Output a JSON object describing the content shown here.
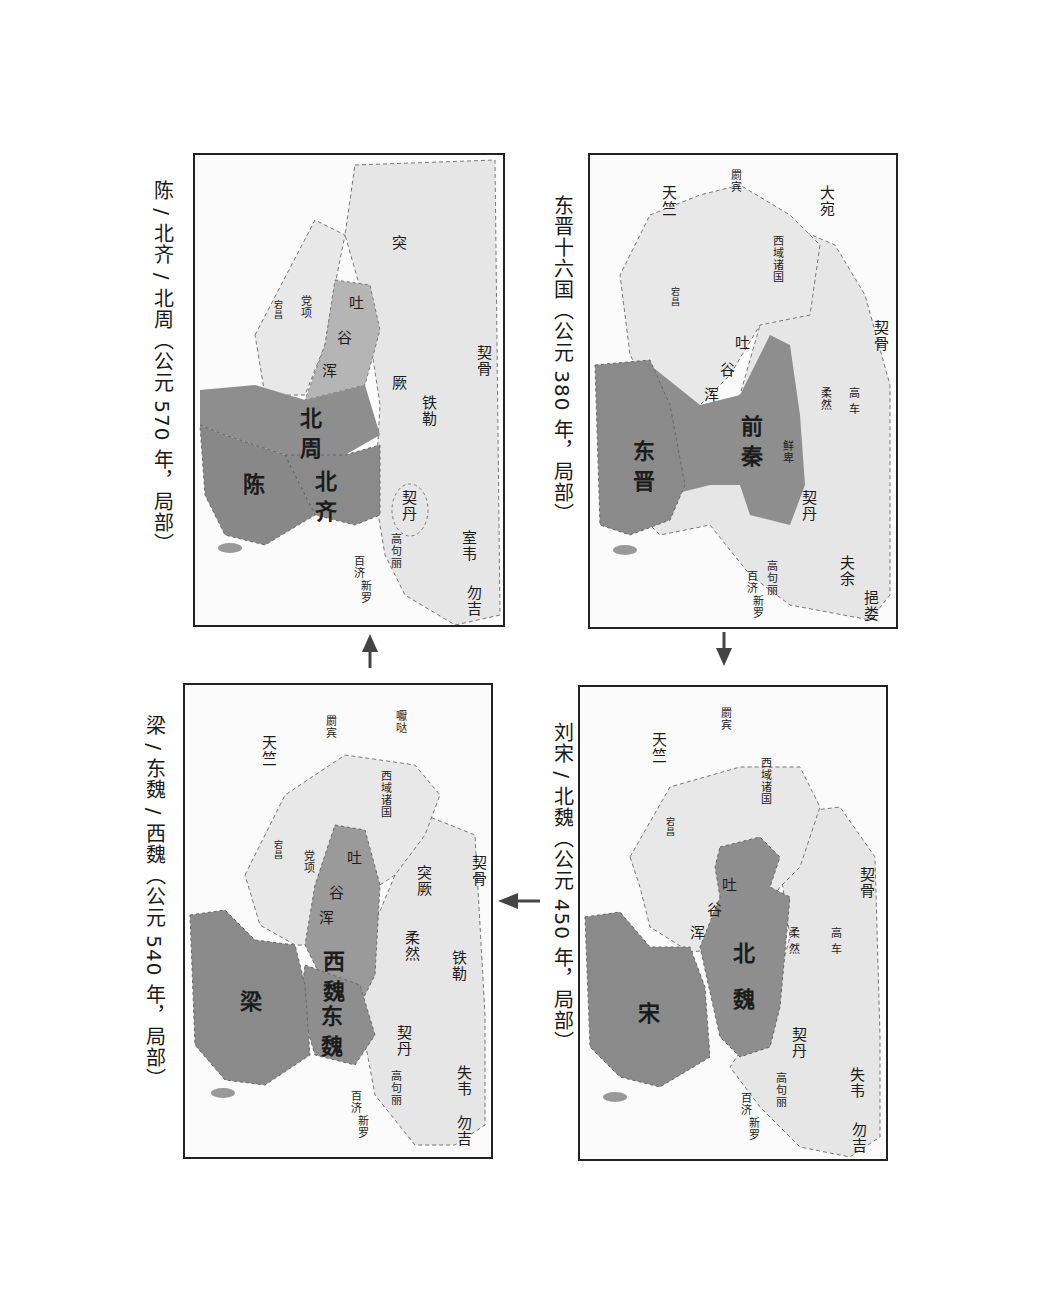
{
  "panels": [
    {
      "id": "p380",
      "caption": "东晋十六国（公元 380 年，局部）",
      "labels": {
        "dawan": "大宛",
        "jibin": "罽宾",
        "tianzhu": "天竺",
        "xiyu": "西域诸国",
        "dangchang": "宕昌",
        "tuyuhun": [
          "吐",
          "谷",
          "浑"
        ],
        "qigu": "契骨",
        "gaoche": "高 车",
        "rouran": "柔然",
        "xianbei": "鲜卑",
        "qianqin": "前秦",
        "dongjin": "东晋",
        "qidan": "契丹",
        "fuyu": "夫余",
        "yilou": "挹娄",
        "gaogouli": "高句丽",
        "baiji": "百济",
        "xinluo": "新罗"
      }
    },
    {
      "id": "p450",
      "caption": "刘宋 / 北魏（公元 450 年，局部）",
      "labels": {
        "jibin": "罽宾",
        "tianzhu": "天竺",
        "xiyu": "西域诸国",
        "dangchang": "宕昌",
        "tuyuhun": [
          "吐",
          "谷",
          "浑"
        ],
        "qigu": "契骨",
        "gaoche": "高 车",
        "rouran": "柔 然",
        "beiwei": "北 魏",
        "song": "宋",
        "qidan": "契丹",
        "shiwei": "失韦",
        "wuji": "勿吉",
        "gaogouli": "高句丽",
        "baiji": "百济",
        "xinluo": "新罗"
      }
    },
    {
      "id": "p540",
      "caption": "梁 / 东魏 / 西魏（公元 540 年，局部）",
      "labels": {
        "yada": "嚈哒",
        "jibin": "罽宾",
        "tianzhu": "天竺",
        "xiyu": "西域诸国",
        "dangxiang": "党项",
        "dangchang": "宕昌",
        "tuyuhun": [
          "吐",
          "谷",
          "浑"
        ],
        "qigu": "契骨",
        "tujue": "突厥",
        "tiele": "铁勒",
        "rouran": "柔然",
        "xiwei": "西魏",
        "dongwei": "东魏",
        "liang": "梁",
        "qidan": "契丹",
        "shiwei": "失韦",
        "wuji": "勿吉",
        "gaogouli": "高句丽",
        "baiji": "百济",
        "xinluo": "新罗"
      }
    },
    {
      "id": "p570",
      "caption": "陈 / 北齐 / 北周（公元 570 年，局部）",
      "labels": {
        "tujue": "突 厥",
        "dangxiang": "党项",
        "dangchang": "宕昌",
        "tuyuhun": [
          "吐",
          "谷",
          "浑"
        ],
        "qigu": "契骨",
        "tiele": "铁勒",
        "beizhou": "北周",
        "beiqi": "北齐",
        "chen": "陈",
        "qidan": "契丹",
        "shiwei": "室韦",
        "wuji": "勿吉",
        "gaogouli": "高句丽",
        "baiji": "百济",
        "xinluo": "新罗"
      }
    }
  ],
  "arrows": [
    {
      "from": "p380",
      "to": "p450",
      "direction": "down"
    },
    {
      "from": "p450",
      "to": "p540",
      "direction": "left"
    },
    {
      "from": "p540",
      "to": "p570",
      "direction": "up"
    }
  ],
  "colors": {
    "dynasty_fill": "#8e8e8e",
    "region_fill": "#e6e6e6",
    "border": "#222222",
    "dashed_boundary": "#777777"
  }
}
